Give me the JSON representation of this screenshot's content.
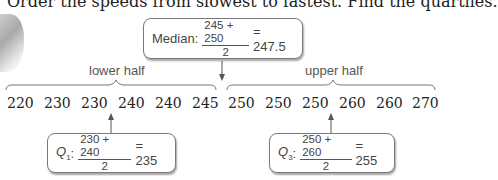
{
  "heading": "Order the speeds from slowest to fastest. Find the quartiles.",
  "median_box": {
    "label": "Median:",
    "numerator": "245 + 250",
    "denominator": "2",
    "result": "= 247.5"
  },
  "lower_half_label": "lower half",
  "upper_half_label": "upper half",
  "values": [
    "220",
    "230",
    "230",
    "240",
    "240",
    "245",
    "250",
    "250",
    "250",
    "260",
    "260",
    "270"
  ],
  "q1_box": {
    "label": "Q",
    "subscript": "1",
    "colon": ":",
    "numerator": "230 + 240",
    "denominator": "2",
    "result": "= 235"
  },
  "q3_box": {
    "label": "Q",
    "subscript": "3",
    "colon": ":",
    "numerator": "250 + 260",
    "denominator": "2",
    "result": "= 255"
  },
  "colors": {
    "box_border": "#7a7a7a",
    "text": "#444444",
    "arrow": "#555555"
  }
}
